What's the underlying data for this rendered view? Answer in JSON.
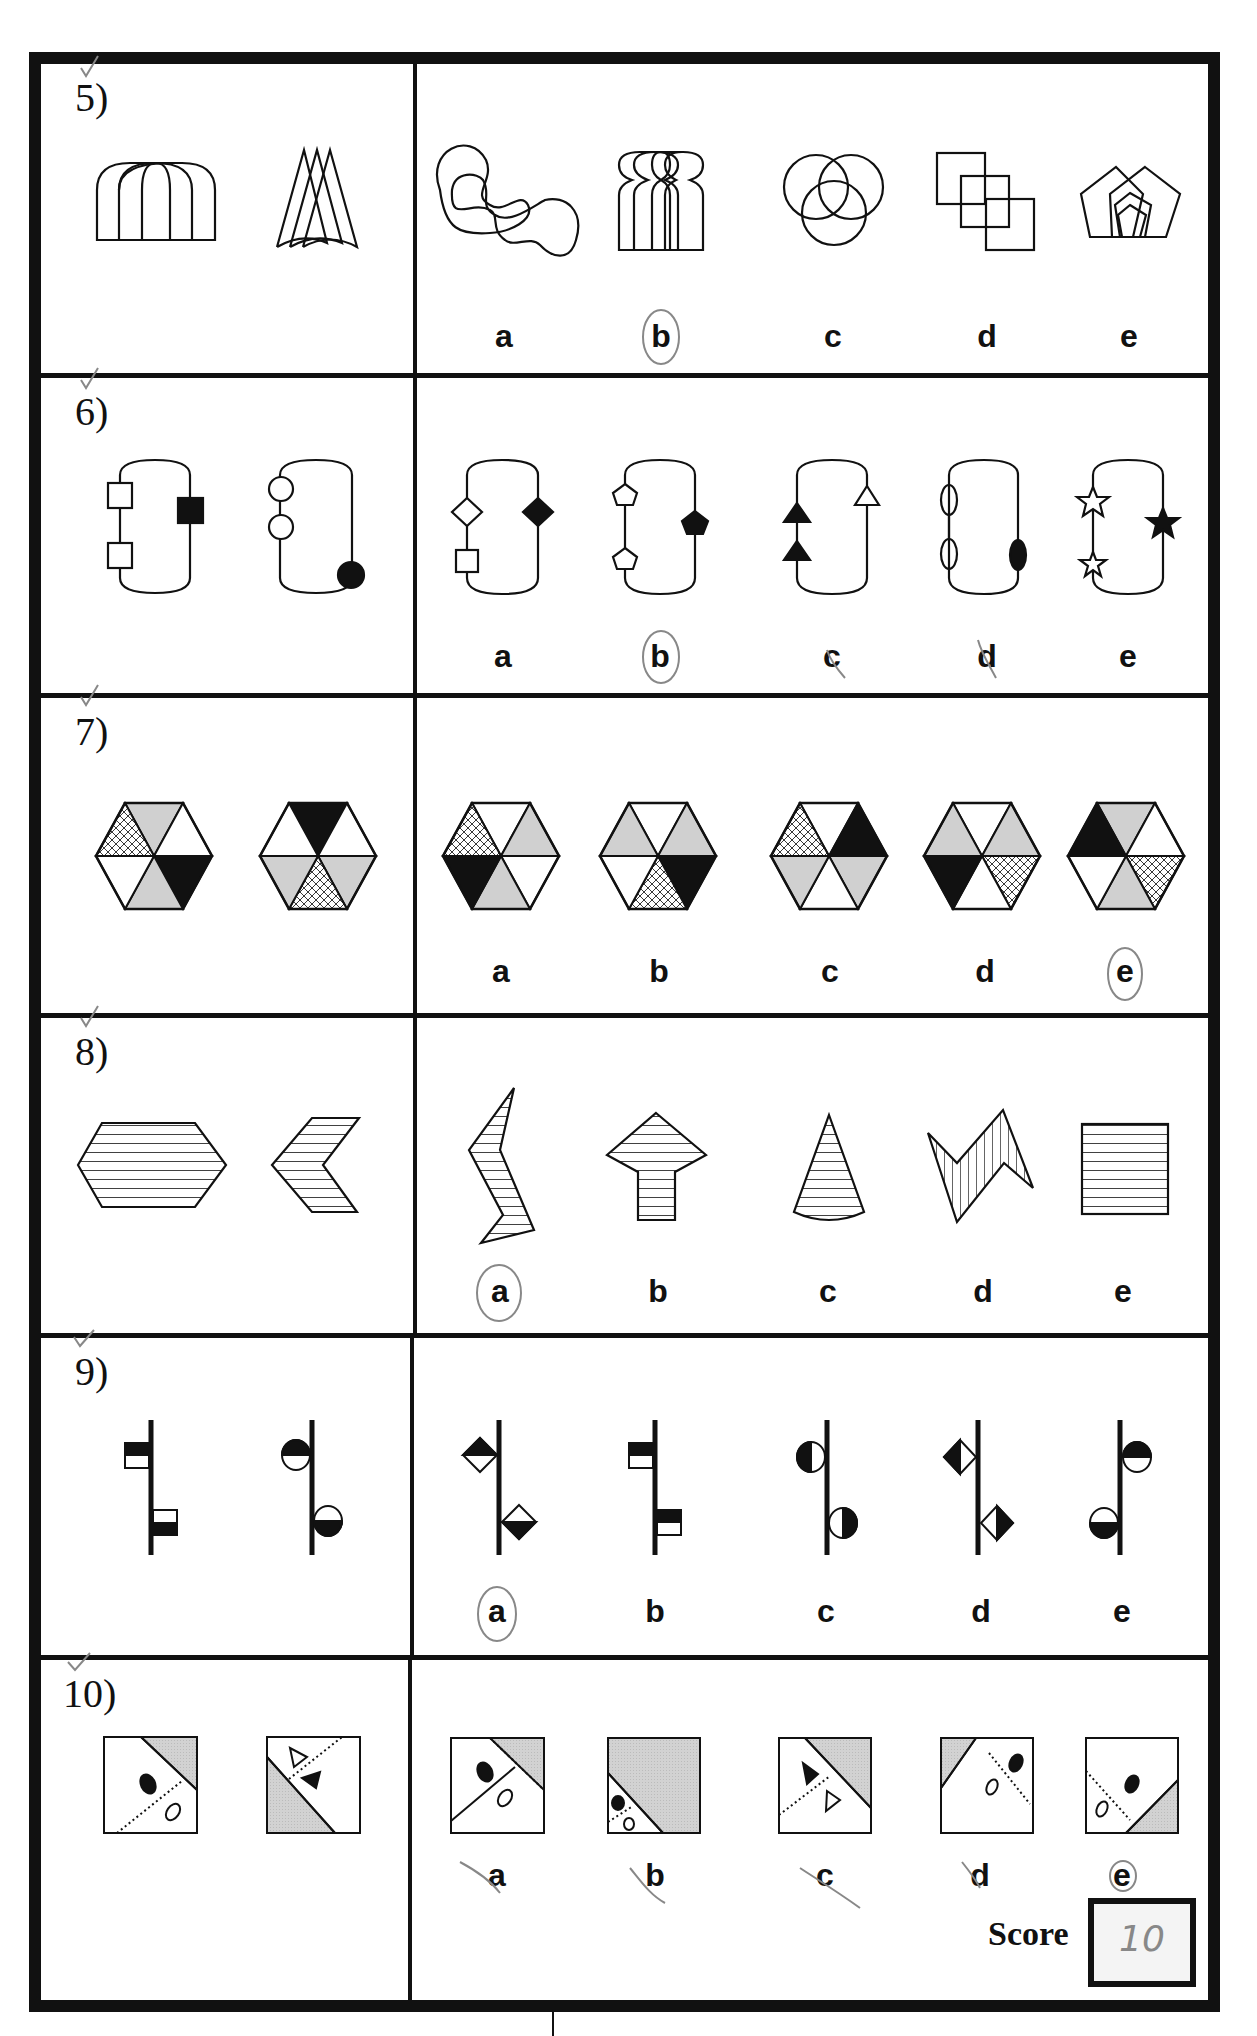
{
  "questions": [
    {
      "number": "5)",
      "options": [
        "a",
        "b",
        "c",
        "d",
        "e"
      ],
      "circled": "b",
      "left_figures": [
        "overlapping-arches",
        "overlapping-cones"
      ],
      "option_figures": [
        "overlapping-blobs",
        "overlapping-arches-with-bulbs",
        "three-overlapping-circles",
        "three-overlapping-squares",
        "nested-overlapping-pentagons"
      ]
    },
    {
      "number": "6)",
      "options": [
        "a",
        "b",
        "c",
        "d",
        "e"
      ],
      "circled": "b",
      "left_figures": [
        "loop-two-white-squares-one-black-square",
        "loop-two-white-circles-one-black-circle"
      ],
      "option_figures": [
        "loop-white-diamond-white-square-black-diamond",
        "loop-two-white-pentagons-black-pentagon",
        "loop-two-black-triangles-white-triangle",
        "loop-two-white-ellipses-black-ellipse",
        "loop-two-white-stars-black-star"
      ]
    },
    {
      "number": "7)",
      "options": [
        "a",
        "b",
        "c",
        "d",
        "e"
      ],
      "circled": "e",
      "left_figures": [
        {
          "top": "gray",
          "ur": "white",
          "lr": "black",
          "bottom": "gray",
          "ll": "white",
          "ul": "hatch"
        },
        {
          "top": "black",
          "ur": "white",
          "lr": "gray",
          "bottom": "hatch",
          "ll": "gray",
          "ul": "white"
        }
      ],
      "option_figures": [
        {
          "top": "white",
          "ur": "gray",
          "lr": "white",
          "bottom": "gray",
          "ll": "black",
          "ul": "hatch"
        },
        {
          "top": "white",
          "ur": "gray",
          "lr": "black",
          "bottom": "hatch",
          "ll": "white",
          "ul": "gray"
        },
        {
          "top": "white",
          "ur": "black",
          "lr": "gray",
          "bottom": "white",
          "ll": "gray",
          "ul": "hatch"
        },
        {
          "top": "white",
          "ur": "gray",
          "lr": "hatch",
          "bottom": "white",
          "ll": "black",
          "ul": "gray"
        },
        {
          "top": "gray",
          "ur": "white",
          "lr": "hatch",
          "bottom": "gray",
          "ll": "white",
          "ul": "black"
        }
      ]
    },
    {
      "number": "8)",
      "options": [
        "a",
        "b",
        "c",
        "d",
        "e"
      ],
      "circled": "a",
      "left_figures": [
        "striped-hexagon",
        "striped-chevron"
      ],
      "option_figures": [
        "striped-zigzag",
        "striped-arrow",
        "striped-cone",
        "vertical-striped-zigzag",
        "striped-square"
      ]
    },
    {
      "number": "9)",
      "options": [
        "a",
        "b",
        "c",
        "d",
        "e"
      ],
      "circled": "a",
      "left_figures": [
        "line-half-filled-squares",
        "line-half-filled-circles"
      ],
      "option_figures": [
        "line-half-filled-diamonds",
        "line-squares-both-black-top",
        "line-circles-black-left-right",
        "line-diamonds-black-left-right",
        "line-circles-swapped-sides"
      ]
    },
    {
      "number": "10)",
      "options": [
        "a",
        "b",
        "c",
        "d",
        "e"
      ],
      "circled": "e",
      "left_figures": [
        "square-gray-corner-ellipses",
        "square-gray-corner-triangles"
      ],
      "option_figures": [
        "square-a",
        "square-b",
        "square-c",
        "square-d",
        "square-e"
      ]
    }
  ],
  "score": {
    "label": "Score",
    "value": "10"
  },
  "colors": {
    "ink": "#111111",
    "gray_fill": "#d0d0d0",
    "pencil": "#888888"
  }
}
